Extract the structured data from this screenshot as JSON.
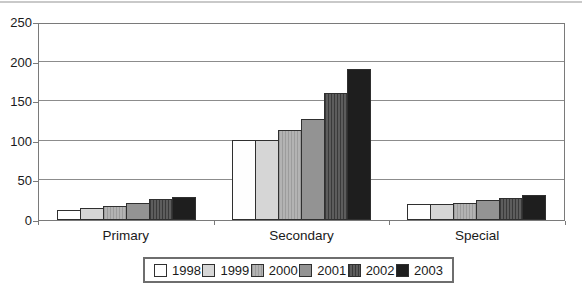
{
  "figure": {
    "background_color": "#ffffff",
    "top_rule_color": "#c9c9c9"
  },
  "chart_data": {
    "type": "bar",
    "title": "",
    "xlabel": "",
    "ylabel": "",
    "categories": [
      "Primary",
      "Secondary",
      "Special"
    ],
    "series": [
      {
        "name": "1998",
        "values": [
          13,
          101,
          20
        ],
        "fill": "#fefefe",
        "pattern": "none"
      },
      {
        "name": "1999",
        "values": [
          15,
          101,
          20
        ],
        "fill": "#d6d6d6",
        "pattern": "none"
      },
      {
        "name": "2000",
        "values": [
          18,
          114,
          21
        ],
        "fill": "#b3b3b3",
        "pattern": "fine-vertical-lines"
      },
      {
        "name": "2001",
        "values": [
          22,
          128,
          25
        ],
        "fill": "#939393",
        "pattern": "none"
      },
      {
        "name": "2002",
        "values": [
          26,
          160,
          28
        ],
        "fill": "#5d5d5d",
        "pattern": "vertical-lines"
      },
      {
        "name": "2003",
        "values": [
          29,
          191,
          31
        ],
        "fill": "#1e1e1e",
        "pattern": "none"
      }
    ],
    "ylim": [
      0,
      250
    ],
    "yticks": [
      0,
      50,
      100,
      150,
      200,
      250
    ],
    "grid": true,
    "legend_position": "bottom",
    "colors": {
      "bar_border": "#2f2f2f",
      "axis_border": "#7a7a7a",
      "gridline": "#8c8c8c",
      "text": "#1a1a1a"
    }
  }
}
